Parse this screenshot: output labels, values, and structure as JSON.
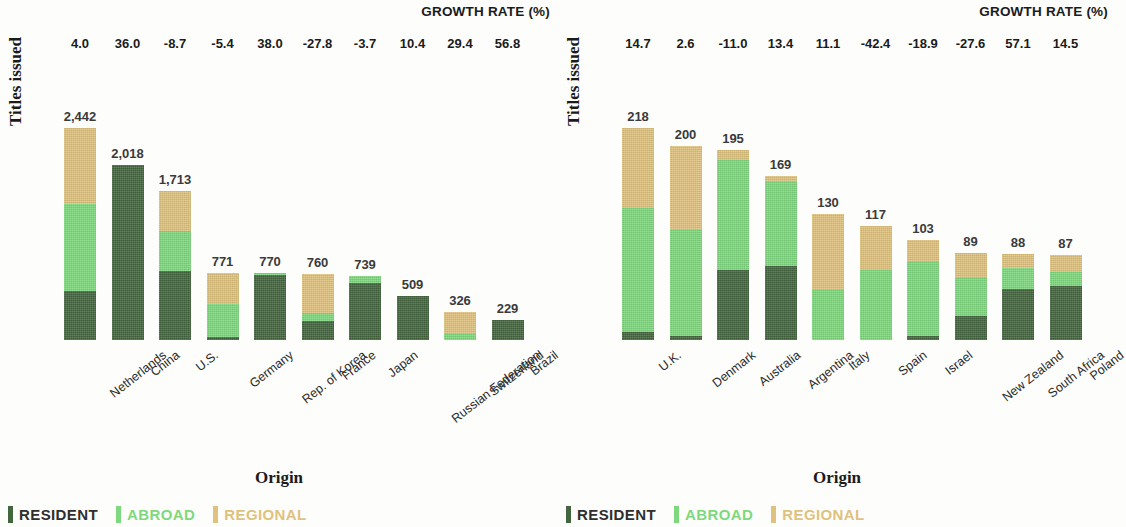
{
  "legend": {
    "items": [
      {
        "key": "resident",
        "label": "RESIDENT",
        "color": "#44663f"
      },
      {
        "key": "abroad",
        "label": "ABROAD",
        "color": "#7ed97e"
      },
      {
        "key": "regional",
        "label": "REGIONAL",
        "color": "#dfc27d"
      }
    ]
  },
  "axis": {
    "y_title": "Titles issued",
    "x_title": "Origin"
  },
  "growth_header": "GROWTH RATE (%)",
  "chart_data": [
    {
      "type": "bar",
      "panel": "left",
      "stacked": true,
      "title": "",
      "xlabel": "Origin",
      "ylabel": "Titles issued",
      "ylim": [
        0,
        2442
      ],
      "grid": false,
      "legend_position": "bottom-left",
      "categories": [
        "Netherlands",
        "China",
        "U.S.",
        "Germany",
        "Rep. of Korea",
        "France",
        "Japan",
        "Russian Federation",
        "Switzerland",
        "Brazil"
      ],
      "totals": [
        2442,
        2018,
        1713,
        771,
        770,
        760,
        739,
        509,
        326,
        229
      ],
      "total_labels": [
        "2,442",
        "2,018",
        "1,713",
        "771",
        "770",
        "760",
        "739",
        "509",
        "326",
        "229"
      ],
      "growth_rate_label": "GROWTH RATE (%)",
      "growth_rates": [
        4.0,
        36.0,
        -8.7,
        -5.4,
        38.0,
        -27.8,
        -3.7,
        10.4,
        29.4,
        56.8
      ],
      "growth_rate_labels": [
        "4.0",
        "36.0",
        "-8.7",
        "-5.4",
        "38.0",
        "-27.8",
        "-3.7",
        "10.4",
        "29.4",
        "56.8"
      ],
      "series": [
        {
          "name": "RESIDENT",
          "color": "#44663f",
          "values": [
            570,
            2018,
            790,
            35,
            745,
            215,
            660,
            509,
            0,
            229
          ]
        },
        {
          "name": "ABROAD",
          "color": "#7ed97e",
          "values": [
            1000,
            0,
            470,
            385,
            25,
            100,
            79,
            0,
            80,
            0
          ]
        },
        {
          "name": "REGIONAL",
          "color": "#dfc27d",
          "values": [
            872,
            0,
            453,
            351,
            0,
            445,
            0,
            0,
            246,
            0
          ]
        }
      ]
    },
    {
      "type": "bar",
      "panel": "right",
      "stacked": true,
      "title": "",
      "xlabel": "Origin",
      "ylabel": "Titles issued",
      "ylim": [
        0,
        218
      ],
      "grid": false,
      "legend_position": "bottom-left",
      "categories": [
        "U.K.",
        "Denmark",
        "Australia",
        "Argentina",
        "Italy",
        "Spain",
        "Israel",
        "New Zealand",
        "South Africa",
        "Poland"
      ],
      "totals": [
        218,
        200,
        195,
        169,
        130,
        117,
        103,
        89,
        88,
        87
      ],
      "total_labels": [
        "218",
        "200",
        "195",
        "169",
        "130",
        "117",
        "103",
        "89",
        "88",
        "87"
      ],
      "growth_rate_label": "GROWTH RATE (%)",
      "growth_rates": [
        14.7,
        2.6,
        -11.0,
        13.4,
        11.1,
        -42.4,
        -18.9,
        -27.6,
        57.1,
        14.5
      ],
      "growth_rate_labels": [
        "14.7",
        "2.6",
        "-11.0",
        "13.4",
        "11.1",
        "-42.4",
        "-18.9",
        "-27.6",
        "57.1",
        "14.5"
      ],
      "series": [
        {
          "name": "RESIDENT",
          "color": "#44663f",
          "values": [
            8,
            4,
            72,
            76,
            0,
            0,
            4,
            25,
            52,
            56
          ]
        },
        {
          "name": "ABROAD",
          "color": "#7ed97e",
          "values": [
            128,
            110,
            113,
            88,
            52,
            72,
            77,
            40,
            22,
            14
          ]
        },
        {
          "name": "REGIONAL",
          "color": "#dfc27d",
          "values": [
            82,
            86,
            10,
            5,
            78,
            45,
            22,
            24,
            14,
            17
          ]
        }
      ]
    }
  ]
}
